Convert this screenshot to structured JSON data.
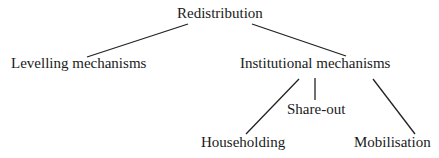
{
  "diagram": {
    "type": "tree",
    "nodes": {
      "root": "Redistribution",
      "levelling": "Levelling mechanisms",
      "institutional": "Institutional mechanisms",
      "shareout": "Share-out",
      "householding": "Householding",
      "mobilisation": "Mobilisation"
    },
    "edges": [
      [
        "Redistribution",
        "Levelling mechanisms"
      ],
      [
        "Redistribution",
        "Institutional mechanisms"
      ],
      [
        "Institutional mechanisms",
        "Householding"
      ],
      [
        "Institutional mechanisms",
        "Share-out"
      ],
      [
        "Institutional mechanisms",
        "Mobilisation"
      ]
    ],
    "line_color": "#222222"
  }
}
